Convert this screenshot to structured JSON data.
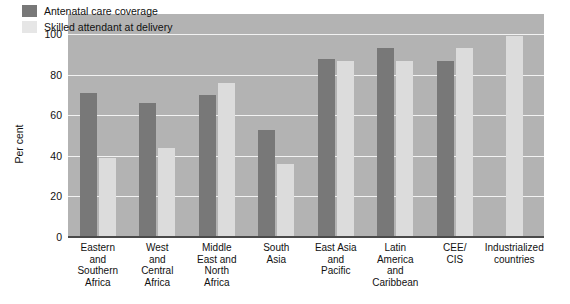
{
  "chart_data": {
    "type": "bar",
    "title": "",
    "subtitle": "",
    "xlabel": "",
    "ylabel": "Per cent",
    "ylim": [
      0,
      110
    ],
    "yticks": [
      0,
      20,
      40,
      60,
      80,
      100
    ],
    "ytick_labels": [
      "0",
      "20",
      "40",
      "60",
      "80",
      "100"
    ],
    "grid": true,
    "legend_position": "top-left",
    "categories": [
      "Eastern\nand\nSouthern\nAfrica",
      "West\nand\nCentral\nAfrica",
      "Middle\nEast and\nNorth\nAfrica",
      "South\nAsia",
      "East Asia\nand\nPacific",
      "Latin\nAmerica\nand\nCaribbean",
      "CEE/\nCIS",
      "Industrialized\ncountries"
    ],
    "series": [
      {
        "name": "Antenatal care coverage",
        "color": "#787878",
        "values": [
          71,
          66,
          70,
          53,
          88,
          93,
          87,
          null
        ]
      },
      {
        "name": "Skilled attendant at delivery",
        "color": "#dcdcdc",
        "values": [
          39,
          44,
          76,
          36,
          87,
          87,
          93,
          99
        ]
      }
    ]
  },
  "legend": {
    "items": [
      {
        "label": "Antenatal care coverage",
        "swatch": "dark"
      },
      {
        "label": "Skilled attendant at delivery",
        "swatch": "light"
      }
    ]
  },
  "colors": {
    "plot_background": "#b3b3b3",
    "gridline": "#f2f2f2",
    "axis": "#4a4a4a",
    "series_dark": "#787878",
    "series_light": "#dcdcdc",
    "page_background": "#ffffff",
    "text": "#111111"
  }
}
